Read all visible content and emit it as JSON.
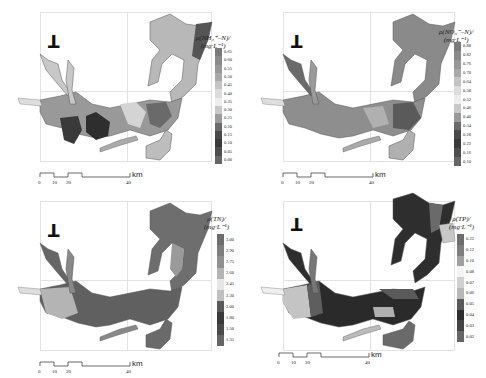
{
  "figure": {
    "panels": [
      {
        "id": "nh4",
        "north_label": "T",
        "legend": {
          "title_line1": "ρ(NH₄⁺–N)/",
          "title_line2": "(mg·L⁻¹)",
          "ticks": [
            "0.65",
            "0.60",
            "0.55",
            "0.50",
            "0.45",
            "0.40",
            "0.35",
            "0.30",
            "0.25",
            "0.20",
            "0.15",
            "0.10",
            "0.05",
            "0.00"
          ],
          "colors": [
            "#7a7a7a",
            "#8a8a8a",
            "#989898",
            "#a8a8a8",
            "#c4c4c4",
            "#dcdcdc",
            "#eeeeee",
            "#c8c8c8",
            "#9a9a9a",
            "#6a6a6a",
            "#4a4a4a",
            "#3a3a3a",
            "#4e4e4e",
            "#666666"
          ]
        },
        "scale": {
          "ticks": [
            "0",
            "10",
            "20",
            "40"
          ],
          "unit": "km"
        }
      },
      {
        "id": "no3",
        "north_label": "T",
        "legend": {
          "title_line1": "ρ(NO₃⁻–N)/",
          "title_line2": "(mg·L⁻¹)",
          "ticks": [
            "0.88",
            "0.82",
            "0.76",
            "0.70",
            "0.64",
            "0.58",
            "0.52",
            "0.46",
            "0.40",
            "0.34",
            "0.28",
            "0.22",
            "0.16",
            "0.10"
          ],
          "colors": [
            "#7a7a7a",
            "#8a8a8a",
            "#989898",
            "#a8a8a8",
            "#c4c4c4",
            "#dcdcdc",
            "#eeeeee",
            "#c8c8c8",
            "#9a9a9a",
            "#6a6a6a",
            "#4a4a4a",
            "#3a3a3a",
            "#4e4e4e",
            "#666666"
          ]
        },
        "scale": {
          "ticks": [
            "0",
            "10",
            "20",
            "40"
          ],
          "unit": "km"
        }
      },
      {
        "id": "tn",
        "north_label": "T",
        "legend": {
          "title_line1": "ρ(TN)/",
          "title_line2": "(mg·L⁻¹)",
          "ticks": [
            "3.00",
            "2.90",
            "2.75",
            "2.60",
            "2.45",
            "2.30",
            "2.00",
            "1.80",
            "1.50",
            "1.35"
          ],
          "colors": [
            "#6e6e6e",
            "#7e7e7e",
            "#909090",
            "#b4b4b4",
            "#e6e6e6",
            "#c0c0c0",
            "#5a5a5a",
            "#3a3a3a",
            "#4a4a4a",
            "#666666"
          ]
        },
        "scale": {
          "ticks": [
            "0",
            "10",
            "20",
            "40"
          ],
          "unit": "km"
        }
      },
      {
        "id": "tp",
        "north_label": "T",
        "legend": {
          "title_line1": "ρ(TP)/",
          "title_line2": "(mg·L⁻¹)",
          "ticks": [
            "0.22",
            "0.12",
            "0.10",
            "0.08",
            "0.07",
            "0.06",
            "0.05",
            "0.04",
            "0.03",
            "0.02"
          ],
          "colors": [
            "#6e6e6e",
            "#7e7e7e",
            "#a0a0a0",
            "#f4f4f4",
            "#d0d0d0",
            "#b8b8b8",
            "#5a5a5a",
            "#2e2e2e",
            "#444444",
            "#666666"
          ]
        },
        "scale": {
          "ticks": [
            "0",
            "10",
            "20",
            "40"
          ],
          "unit": "km"
        }
      }
    ]
  }
}
